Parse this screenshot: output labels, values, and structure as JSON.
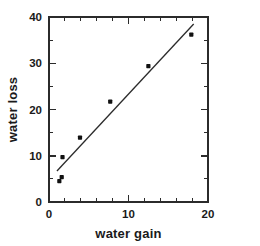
{
  "chart_data": {
    "type": "scatter",
    "title": "",
    "xlabel": "water gain",
    "ylabel": "water loss",
    "xlim": [
      0,
      20
    ],
    "ylim": [
      0,
      40
    ],
    "grid": false,
    "legend": false,
    "x_ticks": [
      0,
      10,
      20
    ],
    "x_tick_labels": [
      "0",
      "10",
      "20"
    ],
    "x_minor_tick_step": 2,
    "y_ticks": [
      0,
      10,
      20,
      30,
      40
    ],
    "y_tick_labels": [
      "0",
      "10",
      "20",
      "30",
      "40"
    ],
    "y_minor_tick_step": 5,
    "marker": "filled-square-dot",
    "marker_color": "#111111",
    "line_color": "#2b2b2b",
    "points": [
      {
        "x": 1.3,
        "y": 4.5
      },
      {
        "x": 1.6,
        "y": 5.4
      },
      {
        "x": 1.7,
        "y": 9.7
      },
      {
        "x": 3.9,
        "y": 13.9
      },
      {
        "x": 7.7,
        "y": 21.7
      },
      {
        "x": 12.5,
        "y": 29.4
      },
      {
        "x": 17.9,
        "y": 36.2
      }
    ],
    "fit_line": {
      "name": "least-squares fit",
      "x_start": 1.0,
      "y_start": 6.7,
      "x_end": 18.2,
      "y_end": 38.5
    }
  },
  "axes": {
    "x_title": "water gain",
    "y_title": "water loss"
  }
}
